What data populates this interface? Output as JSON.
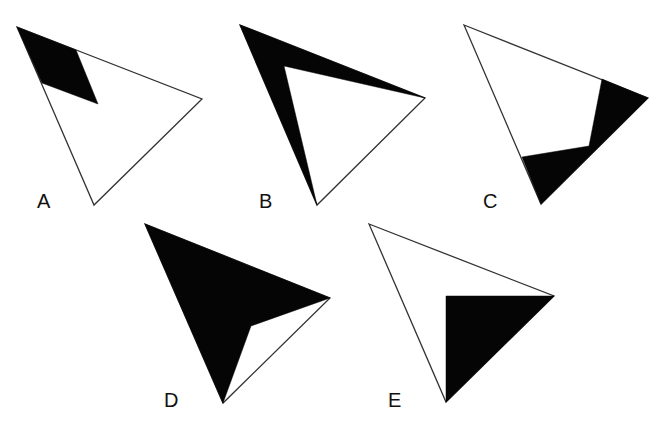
{
  "figure": {
    "colors": {
      "background": "#ffffff",
      "outline": "#333333",
      "shade": "#050505"
    },
    "options": [
      {
        "label": "A",
        "label_pos": [
          37,
          208
        ],
        "triangle": [
          [
            17,
            27
          ],
          [
            202,
            99
          ],
          [
            94,
            205
          ]
        ],
        "shaded": [
          [
            17,
            27
          ],
          [
            76,
            50
          ],
          [
            98,
            104
          ],
          [
            42,
            83
          ]
        ]
      },
      {
        "label": "B",
        "label_pos": [
          259,
          208
        ],
        "triangle": [
          [
            240,
            25
          ],
          [
            425,
            98
          ],
          [
            317,
            205
          ]
        ],
        "shaded": [
          [
            240,
            25
          ],
          [
            425,
            98
          ],
          [
            284,
            66
          ],
          [
            317,
            205
          ]
        ]
      },
      {
        "label": "C",
        "label_pos": [
          483,
          208
        ],
        "triangle": [
          [
            464,
            25
          ],
          [
            648,
            98
          ],
          [
            541,
            204
          ]
        ],
        "shaded": [
          [
            602,
            79
          ],
          [
            648,
            98
          ],
          [
            541,
            204
          ],
          [
            522,
            157
          ],
          [
            589,
            146
          ]
        ]
      },
      {
        "label": "D",
        "label_pos": [
          164,
          407
        ],
        "triangle": [
          [
            145,
            224
          ],
          [
            330,
            298
          ],
          [
            223,
            403
          ]
        ],
        "shaded": [
          [
            145,
            224
          ],
          [
            330,
            298
          ],
          [
            251,
            326
          ],
          [
            223,
            403
          ]
        ]
      },
      {
        "label": "E",
        "label_pos": [
          388,
          407
        ],
        "triangle": [
          [
            369,
            224
          ],
          [
            554,
            296
          ],
          [
            446,
            402
          ]
        ],
        "shaded": [
          [
            446,
            296
          ],
          [
            554,
            296
          ],
          [
            446,
            402
          ]
        ]
      }
    ]
  }
}
